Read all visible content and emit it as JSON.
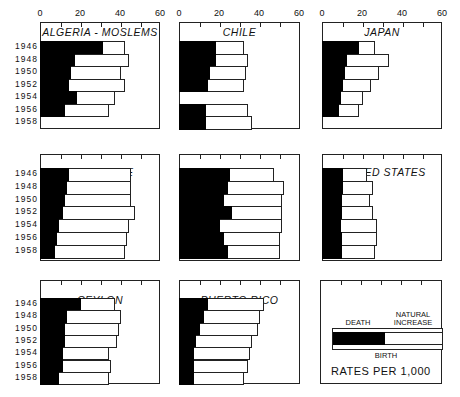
{
  "chart_data": {
    "type": "bar",
    "subtype": "small-multiples horizontal stacked bars (death rate + natural increase = birth rate)",
    "x_ticks": [
      0,
      20,
      40,
      60
    ],
    "xlim": [
      0,
      60
    ],
    "years": [
      "1946",
      "1948",
      "1950",
      "1952",
      "1954",
      "1956",
      "1958"
    ],
    "legend": {
      "death": "DEATH",
      "natural_increase": "NATURAL\nINCREASE",
      "birth": "BIRTH",
      "units": "RATES PER 1,000"
    },
    "panels": [
      {
        "title": "ALGERIA - MOSLEMS",
        "years": [
          "1946",
          "1948",
          "1950",
          "1952",
          "1954",
          "1956",
          "1958"
        ],
        "death": [
          31,
          17,
          15,
          14,
          18,
          12,
          null
        ],
        "birth": [
          42,
          44,
          40,
          42,
          37,
          34,
          null
        ]
      },
      {
        "title": "CHILE",
        "years": [
          "1946",
          "1948",
          "1950",
          "1952",
          "1954",
          "1956",
          "1958"
        ],
        "death": [
          18,
          18,
          15,
          14,
          null,
          13,
          13
        ],
        "birth": [
          32,
          34,
          33,
          32,
          null,
          34,
          36
        ]
      },
      {
        "title": "JAPAN",
        "years": [
          "1946",
          "1948",
          "1950",
          "1952",
          "1954",
          "1956",
          "1958"
        ],
        "death": [
          18,
          12,
          11,
          10,
          9,
          8,
          null
        ],
        "birth": [
          26,
          33,
          28,
          24,
          20,
          18,
          null
        ]
      },
      {
        "title": "SINGAPORE",
        "years": [
          "1946",
          "1948",
          "1950",
          "1952",
          "1954",
          "1956",
          "1958"
        ],
        "death": [
          14,
          13,
          12,
          11,
          9,
          8,
          7
        ],
        "birth": [
          45,
          45,
          45,
          47,
          44,
          43,
          42
        ]
      },
      {
        "title": "GUATEMALA",
        "years": [
          "1946",
          "1948",
          "1950",
          "1952",
          "1954",
          "1956",
          "1958"
        ],
        "death": [
          25,
          24,
          22,
          26,
          20,
          22,
          24
        ],
        "birth": [
          47,
          52,
          51,
          51,
          51,
          50,
          50
        ]
      },
      {
        "title": "UNITED STATES",
        "years": [
          "1946",
          "1948",
          "1950",
          "1952",
          "1954",
          "1956",
          "1958"
        ],
        "death": [
          10,
          10,
          9.6,
          9.6,
          9.2,
          9.3,
          9.5
        ],
        "birth": [
          22,
          25,
          23.5,
          25,
          27,
          27,
          26
        ]
      },
      {
        "title": "CEYLON",
        "years": [
          "1946",
          "1948",
          "1950",
          "1952",
          "1954",
          "1956",
          "1958"
        ],
        "death": [
          20,
          13,
          12,
          12,
          11,
          11,
          9
        ],
        "birth": [
          37,
          40,
          39,
          38,
          34,
          35,
          34
        ]
      },
      {
        "title": "PUERTO RICO",
        "years": [
          "1946",
          "1948",
          "1950",
          "1952",
          "1954",
          "1956",
          "1958"
        ],
        "death": [
          14,
          12,
          10,
          8,
          7,
          7,
          7
        ],
        "birth": [
          42,
          40,
          39,
          36,
          35,
          34,
          32
        ]
      }
    ],
    "grid": false
  },
  "axis": {
    "ticks": [
      "0",
      "20",
      "40",
      "60"
    ]
  },
  "year_labels": [
    "1946",
    "1948",
    "1950",
    "1952",
    "1954",
    "1956",
    "1958"
  ],
  "titles": {
    "algeria": "ALGERIA - MOSLEMS",
    "chile": "CHILE",
    "japan": "JAPAN",
    "singapore": "SINGAPORE",
    "guatemala": "GUATEMALA",
    "us": "UNITED STATES",
    "ceylon": "CEYLON",
    "puerto_rico": "PUERTO RICO"
  },
  "legend": {
    "death": "DEATH",
    "natural_line1": "NATURAL",
    "natural_line2": "INCREASE",
    "birth": "BIRTH",
    "rates": "RATES PER 1,000"
  }
}
